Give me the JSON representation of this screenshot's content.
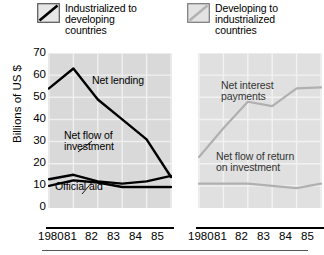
{
  "legend": {
    "left": {
      "label": "Industrialized to\ndeveloping\ncountries",
      "swatch_icon": "diagonal-line-swatch-dark",
      "color": "#000000"
    },
    "right": {
      "label": "Developing to\nindustrialized\ncountries",
      "swatch_icon": "diagonal-line-swatch-light",
      "color": "#b3b3b3"
    }
  },
  "axes": {
    "y_title": "Billions of US $",
    "y_ticks": [
      "70",
      "60",
      "50",
      "40",
      "30",
      "20",
      "10",
      "0"
    ],
    "x_labels": [
      "1980",
      "81",
      "82",
      "83",
      "84",
      "85"
    ]
  },
  "chart_data": [
    {
      "type": "line",
      "title": "Industrialized to developing countries",
      "xlabel": "",
      "ylabel": "Billions of US $",
      "x": [
        "1980",
        "81",
        "82",
        "83",
        "84",
        "85"
      ],
      "ylim": [
        0,
        70
      ],
      "grid": true,
      "plot_bg": "#d9d9d9",
      "series": [
        {
          "name": "Net lending",
          "color": "#000000",
          "values": [
            54,
            63,
            49,
            40,
            31,
            14
          ]
        },
        {
          "name": "Net flow of investment",
          "color": "#000000",
          "values": [
            13,
            15,
            12,
            11,
            12,
            14.5
          ]
        },
        {
          "name": "Official aid",
          "color": "#000000",
          "values": [
            10,
            12.5,
            11.5,
            9.5,
            9.5,
            9.5
          ]
        }
      ],
      "annotations": [
        {
          "text": "Net lending",
          "series": "Net lending"
        },
        {
          "text": "Net flow of\ninvestment",
          "series": "Net flow of investment"
        },
        {
          "text": "Official aid",
          "series": "Official aid"
        }
      ]
    },
    {
      "type": "line",
      "title": "Developing to industrialized countries",
      "xlabel": "",
      "ylabel": "Billions of US $",
      "x": [
        "1980",
        "81",
        "82",
        "83",
        "84",
        "85"
      ],
      "ylim": [
        0,
        70
      ],
      "grid": true,
      "plot_bg": "#e0e0e0",
      "series": [
        {
          "name": "Net interest payments",
          "color": "#b0b0b0",
          "values": [
            23,
            36,
            48,
            46,
            54,
            54.5
          ]
        },
        {
          "name": "Net flow of return on investment",
          "color": "#b0b0b0",
          "values": [
            11,
            11,
            11,
            10,
            9,
            11
          ]
        }
      ],
      "annotations": [
        {
          "text": "Net interest\npayments",
          "series": "Net interest payments"
        },
        {
          "text": "Net flow of return\non investment",
          "series": "Net flow of return on investment"
        }
      ]
    }
  ]
}
